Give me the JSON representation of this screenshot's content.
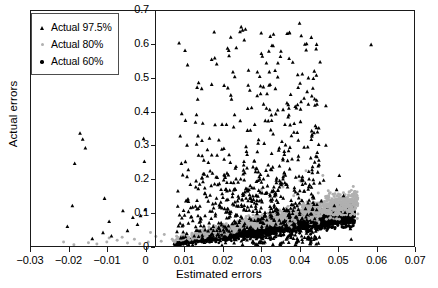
{
  "chart_data": {
    "type": "scatter",
    "title": "",
    "xlabel": "Estimated errors",
    "ylabel": "Actual errors",
    "xlim": [
      -0.03,
      0.07
    ],
    "ylim": [
      0.0,
      0.7
    ],
    "xticks": [
      -0.03,
      -0.02,
      -0.01,
      0,
      0.01,
      0.02,
      0.03,
      0.04,
      0.05,
      0.06,
      0.07
    ],
    "xticklabels": [
      "−0.03",
      "−0.02",
      "−0.01",
      "0",
      "0.01",
      "0.02",
      "0.03",
      "0.04",
      "0.05",
      "0.06",
      "0.07"
    ],
    "yticks": [
      0,
      0.1,
      0.2,
      0.3,
      0.4,
      0.5,
      0.6,
      0.7
    ],
    "yticklabels": [
      "0",
      "0.1",
      "0.2",
      "0.3",
      "0.4",
      "0.5",
      "0.6",
      "0.7"
    ],
    "grid": false,
    "y_axis_position": "at x = 0",
    "legend_position": "upper left (inside)",
    "series": [
      {
        "name": "Actual 97.5%",
        "marker": "triangle",
        "color": "#000000",
        "description": "Sparse black triangles spread widely in y from 0 to 0.70, concentrated for estimated errors between 0.008 and 0.045; a few outliers at negative estimated errors from -0.022 to -0.004 with actual errors up to 0.34."
      },
      {
        "name": "Actual 80%",
        "marker": "circle",
        "color": "#b0b0b0",
        "description": "Light gray dots forming a narrow upward band from (0.007, 0.01) to (0.055, 0.16), lying just above the black 60% band."
      },
      {
        "name": "Actual 60%",
        "marker": "circle",
        "color": "#000000",
        "description": "Dense black dots forming a tight upward wedge from (0.007, 0.00) to (0.054, 0.11), the lowest and densest band."
      }
    ]
  },
  "legend": {
    "entries": [
      {
        "label": "Actual 97.5%",
        "marker": "triangle-icon",
        "color": "#000000"
      },
      {
        "label": "Actual 80%",
        "marker": "circle-icon",
        "color": "#b0b0b0"
      },
      {
        "label": "Actual 60%",
        "marker": "circle-icon",
        "color": "#000000"
      }
    ]
  }
}
